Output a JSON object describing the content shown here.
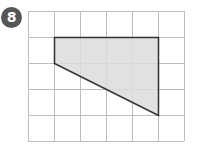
{
  "badge": {
    "label": "8",
    "color": "#555555"
  },
  "grid": {
    "cols": 6,
    "rows": 5,
    "cell": 26,
    "origin": [
      28,
      11
    ],
    "line_color": "#bdbdbd"
  },
  "shape": {
    "vertices_grid": [
      [
        1,
        1
      ],
      [
        5,
        1
      ],
      [
        5,
        4
      ],
      [
        1,
        2
      ]
    ],
    "fill": "#dcdcdc",
    "stroke": "#333333"
  }
}
